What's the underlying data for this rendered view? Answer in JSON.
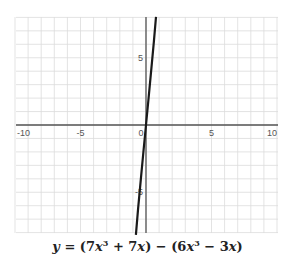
{
  "chart_data": {
    "type": "line",
    "title": "",
    "equation": "y = (7x³ + 7x) − (6x³ − 3x)",
    "simplified": "y = x³ + 10x",
    "xlabel": "",
    "ylabel": "",
    "xlim": [
      -10,
      10
    ],
    "ylim": [
      -8,
      8
    ],
    "grid": true,
    "x_ticks": [
      -10,
      -5,
      0,
      5,
      10
    ],
    "y_ticks": [
      5,
      -5
    ],
    "series": [
      {
        "name": "y = (7x^3 + 7x) - (6x^3 - 3x)",
        "x": [
          -0.77,
          -0.6,
          -0.4,
          -0.2,
          0,
          0.2,
          0.4,
          0.6,
          0.76
        ],
        "values": [
          -8.16,
          -6.22,
          -4.06,
          -2.01,
          0,
          2.01,
          4.06,
          6.22,
          8.04
        ],
        "color": "#1a1a1a"
      }
    ]
  },
  "labels": {
    "x_ticks": [
      "-10",
      "-5",
      "0",
      "5",
      "10"
    ],
    "y_ticks": [
      "5",
      "-5"
    ],
    "eq_y": "y",
    "eq_eq": " = (",
    "eq_7x": "7",
    "eq_x1": "x",
    "eq_exp1": "3",
    "eq_plus": " + 7",
    "eq_x2": "x",
    "eq_mid": ") − (6",
    "eq_x3": "x",
    "eq_exp2": "3",
    "eq_minus": " − 3",
    "eq_x4": "x",
    "eq_end": ")"
  },
  "colors": {
    "grid": "#d9d9d9",
    "axis": "#555555",
    "curve": "#1a1a1a"
  }
}
